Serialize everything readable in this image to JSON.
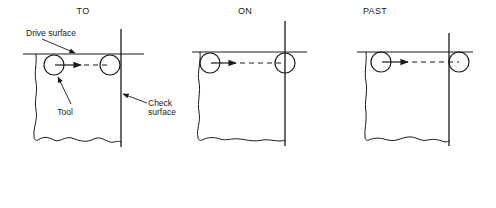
{
  "diagram": {
    "panels": [
      {
        "id": "to",
        "title": "TO"
      },
      {
        "id": "on",
        "title": "ON"
      },
      {
        "id": "past",
        "title": "PAST"
      }
    ],
    "labels": {
      "drive_surface": "Drive surface",
      "tool": "Tool",
      "check_line1": "Check",
      "check_line2": "surface"
    },
    "colors": {
      "line": "#1a1a1a",
      "background": "#ffffff"
    }
  }
}
